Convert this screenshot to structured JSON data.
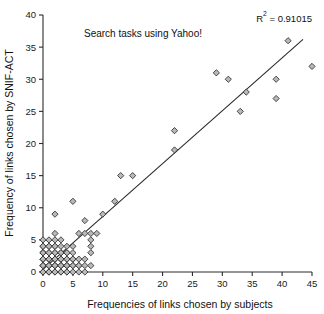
{
  "chart_data": {
    "type": "scatter",
    "title": "Search tasks using Yahoo!",
    "xlabel": "Frequencies of links chosen by subjects",
    "ylabel": "Frequency of links chosen by SNIF-ACT",
    "annotation": "R² = 0.91015",
    "annotation_base": "R",
    "annotation_sup": "2",
    "annotation_rest": " = 0.91015",
    "r_squared": 0.91015,
    "xlim": [
      0,
      45
    ],
    "ylim": [
      0,
      40
    ],
    "xticks": [
      0,
      5,
      10,
      15,
      20,
      25,
      30,
      35,
      40,
      45
    ],
    "yticks": [
      0,
      5,
      10,
      15,
      20,
      25,
      30,
      35,
      40
    ],
    "grid": false,
    "legend": false,
    "marker": "diamond",
    "marker_fill": "#b9b9b9",
    "marker_edge": "#2a2a2a",
    "line_color": "#262626",
    "trend_line": {
      "x0": 0,
      "y0": 0.4,
      "x1": 43.5,
      "y1": 36.2
    },
    "points": [
      [
        0,
        0
      ],
      [
        0,
        0
      ],
      [
        0,
        1
      ],
      [
        0,
        1
      ],
      [
        0,
        2
      ],
      [
        0,
        2
      ],
      [
        0,
        3
      ],
      [
        0,
        3
      ],
      [
        0,
        4
      ],
      [
        0,
        4
      ],
      [
        0,
        5
      ],
      [
        0,
        1
      ],
      [
        0,
        2
      ],
      [
        0,
        3
      ],
      [
        1,
        0
      ],
      [
        1,
        0
      ],
      [
        1,
        1
      ],
      [
        1,
        1
      ],
      [
        1,
        2
      ],
      [
        1,
        2
      ],
      [
        1,
        3
      ],
      [
        1,
        3
      ],
      [
        1,
        4
      ],
      [
        1,
        4
      ],
      [
        1,
        5
      ],
      [
        1,
        1
      ],
      [
        1,
        2
      ],
      [
        1,
        0
      ],
      [
        2,
        0
      ],
      [
        2,
        0
      ],
      [
        2,
        1
      ],
      [
        2,
        1
      ],
      [
        2,
        2
      ],
      [
        2,
        2
      ],
      [
        2,
        3
      ],
      [
        2,
        3
      ],
      [
        2,
        4
      ],
      [
        2,
        4
      ],
      [
        2,
        5
      ],
      [
        2,
        6
      ],
      [
        2,
        9
      ],
      [
        2,
        1
      ],
      [
        2,
        2
      ],
      [
        3,
        0
      ],
      [
        3,
        0
      ],
      [
        3,
        1
      ],
      [
        3,
        1
      ],
      [
        3,
        2
      ],
      [
        3,
        2
      ],
      [
        3,
        3
      ],
      [
        3,
        3
      ],
      [
        3,
        4
      ],
      [
        3,
        5
      ],
      [
        3,
        1
      ],
      [
        3,
        2
      ],
      [
        4,
        0
      ],
      [
        4,
        0
      ],
      [
        4,
        1
      ],
      [
        4,
        1
      ],
      [
        4,
        2
      ],
      [
        4,
        2
      ],
      [
        4,
        3
      ],
      [
        4,
        3
      ],
      [
        4,
        4
      ],
      [
        4,
        1
      ],
      [
        5,
        0
      ],
      [
        5,
        1
      ],
      [
        5,
        1
      ],
      [
        5,
        2
      ],
      [
        5,
        2
      ],
      [
        5,
        3
      ],
      [
        5,
        4
      ],
      [
        5,
        11
      ],
      [
        6,
        0
      ],
      [
        6,
        1
      ],
      [
        6,
        1
      ],
      [
        6,
        2
      ],
      [
        6,
        6
      ],
      [
        7,
        0
      ],
      [
        7,
        1
      ],
      [
        7,
        2
      ],
      [
        7,
        6
      ],
      [
        7,
        8
      ],
      [
        8,
        1
      ],
      [
        8,
        3
      ],
      [
        8,
        4
      ],
      [
        8,
        5
      ],
      [
        8,
        6
      ],
      [
        9,
        6
      ],
      [
        10,
        9
      ],
      [
        12,
        11
      ],
      [
        13,
        15
      ],
      [
        15,
        15
      ],
      [
        22,
        19
      ],
      [
        22,
        22
      ],
      [
        29,
        31
      ],
      [
        31,
        30
      ],
      [
        33,
        25
      ],
      [
        34,
        28
      ],
      [
        39,
        27
      ],
      [
        39,
        30
      ],
      [
        41,
        36
      ],
      [
        45,
        32
      ]
    ]
  }
}
